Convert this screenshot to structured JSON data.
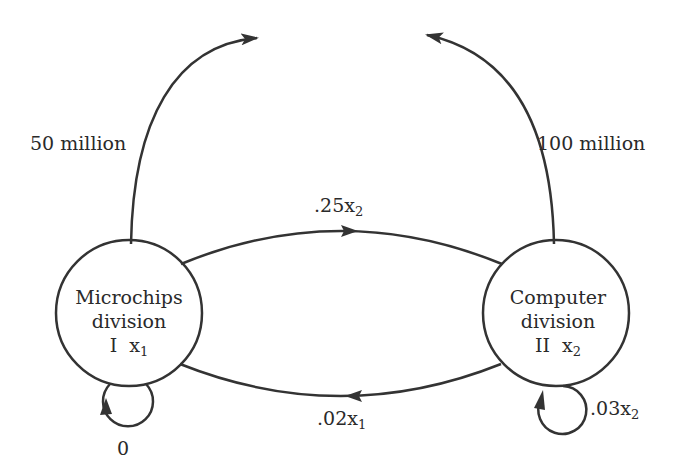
{
  "diagram": {
    "type": "flow-network",
    "nodes": [
      {
        "id": "I",
        "line1": "Microchips",
        "line2": "division",
        "roman": "I",
        "var": "x",
        "sub": "1"
      },
      {
        "id": "II",
        "line1": "Computer",
        "line2": "division",
        "roman": "II",
        "var": "x",
        "sub": "2"
      }
    ],
    "edges": [
      {
        "from": "I",
        "to": "external",
        "label": "50 million"
      },
      {
        "from": "II",
        "to": "external",
        "label": "100 million"
      },
      {
        "from": "I",
        "to": "II",
        "label_coef": ".25x",
        "label_sub": "2"
      },
      {
        "from": "II",
        "to": "I",
        "label_coef": ".02x",
        "label_sub": "1"
      },
      {
        "from": "I",
        "to": "I",
        "label": "0"
      },
      {
        "from": "II",
        "to": "II",
        "label_coef": ".03x",
        "label_sub": "2"
      }
    ],
    "colors": {
      "stroke": "#333333",
      "background": "#ffffff"
    }
  }
}
